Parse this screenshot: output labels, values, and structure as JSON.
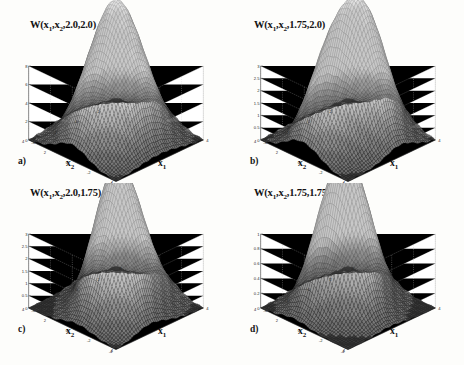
{
  "figure": {
    "background_color": "#fdfdfb",
    "grid_color": "#c4c4c4",
    "axis_color": "#4a4a4a",
    "surface_light": "#f2f2f2",
    "surface_dark": "#3b3b3b",
    "panel_layout": "2x2"
  },
  "panels": [
    {
      "letter": "a)",
      "title_prefix": "W(x",
      "title_sub1": "1",
      "title_mid": ",x",
      "title_sub2": "2",
      "title_suffix": ",2.0,2.0)",
      "xlabel_left": "x",
      "xlabel_left_sub": "2",
      "xlabel_right": "x",
      "xlabel_right_sub": "1",
      "chart_data": {
        "type": "surface",
        "title": "W(x1,x2,2.0,2.0)",
        "xlabel": "x1",
        "ylabel": "x2",
        "zlabel": "W",
        "xlim": [
          -4,
          4
        ],
        "ylim": [
          -4,
          4
        ],
        "zlim": [
          0,
          8
        ],
        "xticks": [
          -4,
          -2,
          0,
          2,
          4
        ],
        "yticks": [
          -4,
          -2,
          0,
          2,
          4
        ],
        "zticks": [
          0,
          2,
          4,
          6,
          8
        ],
        "grid": true,
        "legend": "none",
        "peaks": [
          {
            "x": 0.0,
            "y": 0.0,
            "z": 7.6
          },
          {
            "x": -1.6,
            "y": 0.0,
            "z": 4.0
          },
          {
            "x": 1.6,
            "y": 0.0,
            "z": 4.0
          },
          {
            "x": 0.0,
            "y": -1.6,
            "z": 3.2
          },
          {
            "x": 0.0,
            "y": 1.6,
            "z": 3.2
          },
          {
            "x": -1.6,
            "y": -1.6,
            "z": 2.2
          },
          {
            "x": 1.6,
            "y": -1.6,
            "z": 2.2
          },
          {
            "x": -1.6,
            "y": 1.6,
            "z": 2.2
          },
          {
            "x": 1.6,
            "y": 1.6,
            "z": 2.2
          },
          {
            "x": -3.0,
            "y": 0.0,
            "z": 1.3
          },
          {
            "x": 3.0,
            "y": 0.0,
            "z": 1.3
          }
        ]
      }
    },
    {
      "letter": "b)",
      "title_prefix": "W(x",
      "title_sub1": "1",
      "title_mid": ",x",
      "title_sub2": "2",
      "title_suffix": ",1.75,2.0)",
      "xlabel_left": "x",
      "xlabel_left_sub": "2",
      "xlabel_right": "x",
      "xlabel_right_sub": "1",
      "chart_data": {
        "type": "surface",
        "title": "W(x1,x2,1.75,2.0)",
        "xlabel": "x1",
        "ylabel": "x2",
        "zlabel": "W",
        "xlim": [
          -4,
          4
        ],
        "ylim": [
          -4,
          4
        ],
        "zlim": [
          0,
          3
        ],
        "xticks": [
          -4,
          -2,
          0,
          2,
          4
        ],
        "yticks": [
          -4,
          -2,
          0,
          2,
          4
        ],
        "zticks": [
          0,
          0.5,
          1,
          1.5,
          2,
          2.5,
          3
        ],
        "grid": true,
        "legend": "none",
        "peaks": [
          {
            "x": 0.8,
            "y": -0.8,
            "z": 2.75
          },
          {
            "x": -0.8,
            "y": 0.8,
            "z": 2.2
          },
          {
            "x": 0.8,
            "y": 0.8,
            "z": 1.55
          },
          {
            "x": -0.8,
            "y": -0.8,
            "z": 1.5
          },
          {
            "x": 2.4,
            "y": -0.8,
            "z": 1.25
          },
          {
            "x": -2.4,
            "y": 0.8,
            "z": 1.1
          },
          {
            "x": 2.4,
            "y": 0.8,
            "z": 0.95
          },
          {
            "x": -2.4,
            "y": -0.8,
            "z": 0.85
          },
          {
            "x": 0.8,
            "y": -2.4,
            "z": 0.9
          }
        ]
      }
    },
    {
      "letter": "c)",
      "title_prefix": "W(x",
      "title_sub1": "1",
      "title_mid": ",x",
      "title_sub2": "2",
      "title_suffix": ",2.0,1.75)",
      "xlabel_left": "x",
      "xlabel_left_sub": "2",
      "xlabel_right": "x",
      "xlabel_right_sub": "1",
      "chart_data": {
        "type": "surface",
        "title": "W(x1,x2,2.0,1.75)",
        "xlabel": "x1",
        "ylabel": "x2",
        "zlabel": "W",
        "xlim": [
          -4,
          4
        ],
        "ylim": [
          -4,
          4
        ],
        "zlim": [
          0,
          3
        ],
        "xticks": [
          -4,
          -2,
          0,
          2,
          4
        ],
        "yticks": [
          -4,
          -2,
          0,
          2,
          4
        ],
        "zticks": [
          0,
          0.5,
          1,
          1.5,
          2,
          2.5,
          3
        ],
        "grid": true,
        "legend": "none",
        "peaks": [
          {
            "x": -0.4,
            "y": 0.4,
            "z": 2.8
          },
          {
            "x": 1.2,
            "y": 0.4,
            "z": 2.2
          },
          {
            "x": -0.4,
            "y": -1.2,
            "z": 1.35
          },
          {
            "x": 0.6,
            "y": -1.2,
            "z": 1.3
          },
          {
            "x": -1.9,
            "y": -0.4,
            "z": 1.1
          },
          {
            "x": 2.5,
            "y": -0.6,
            "z": 1.0
          },
          {
            "x": -1.2,
            "y": -2.2,
            "z": 0.8
          },
          {
            "x": 1.0,
            "y": 2.0,
            "z": 0.7
          }
        ]
      }
    },
    {
      "letter": "d)",
      "title_prefix": "W(x",
      "title_sub1": "1",
      "title_mid": ",x",
      "title_sub2": "2",
      "title_suffix": ",1.75,1.75)",
      "xlabel_left": "x",
      "xlabel_left_sub": "2",
      "xlabel_right": "x",
      "xlabel_right_sub": "1",
      "chart_data": {
        "type": "surface",
        "title": "W(x1,x2,1.75,1.75)",
        "xlabel": "x1",
        "ylabel": "x2",
        "zlabel": "W",
        "xlim": [
          -4,
          4
        ],
        "ylim": [
          -4,
          4
        ],
        "zlim": [
          0,
          1
        ],
        "xticks": [
          -4,
          -2,
          0,
          2,
          4
        ],
        "yticks": [
          -4,
          -2,
          0,
          2,
          4
        ],
        "zticks": [
          0,
          0.2,
          0.4,
          0.6,
          0.8,
          1
        ],
        "grid": true,
        "legend": "none",
        "peaks": [
          {
            "x": 0.3,
            "y": 0.9,
            "z": 1.0
          },
          {
            "x": -1.3,
            "y": 0.9,
            "z": 0.87
          },
          {
            "x": 1.7,
            "y": 0.4,
            "z": 0.83
          },
          {
            "x": -0.2,
            "y": -1.1,
            "z": 0.8
          }
        ]
      }
    }
  ]
}
